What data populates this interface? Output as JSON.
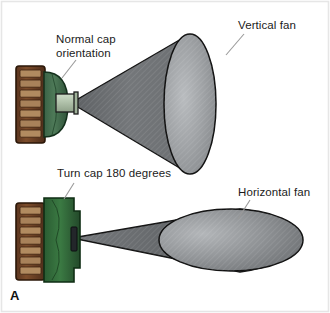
{
  "figure": {
    "panel_letter": "A",
    "background_color": "#ffffff",
    "frame_color": "#e2e2e2",
    "caption_text_color": "#1b1b1b"
  },
  "labels": {
    "normal_cap": "Normal cap\norientation",
    "vertical_fan": "Vertical fan",
    "turn_cap": "Turn cap 180 degrees",
    "horizontal_fan": "Horizontal fan"
  },
  "diagrams": [
    {
      "id": "top-assembly",
      "name": "nozzle-normal-orientation",
      "cartridge_color": "#7a4a28",
      "cartridge_band_color": "#b08a5e",
      "cap_color": "#3f6b4a",
      "nozzle_color": "#b9cbb4",
      "fan_type": "vertical",
      "fan_fill_dark": "#6f7275",
      "fan_fill_light": "#9a9da0",
      "fan_outline": "#111111"
    },
    {
      "id": "bottom-assembly",
      "name": "nozzle-rotated-180",
      "cartridge_color": "#7a4a28",
      "cartridge_band_color": "#b08a5e",
      "cap_color": "#2f6437",
      "nozzle_color": "#33363a",
      "fan_type": "horizontal",
      "fan_fill_dark": "#5f6265",
      "fan_fill_light": "#9a9da0",
      "fan_outline": "#111111"
    }
  ],
  "leader_lines": [
    {
      "name": "leader-normal-cap",
      "from": "label-normal-cap",
      "to": "top-cap"
    },
    {
      "name": "leader-vertical-fan",
      "from": "label-vertical-fan",
      "to": "vertical-fan-face"
    },
    {
      "name": "leader-turn-cap",
      "from": "label-turn-cap",
      "to": "bottom-cap"
    },
    {
      "name": "leader-horizontal-fan",
      "from": "label-horizontal-fan",
      "to": "horizontal-fan-body"
    }
  ]
}
